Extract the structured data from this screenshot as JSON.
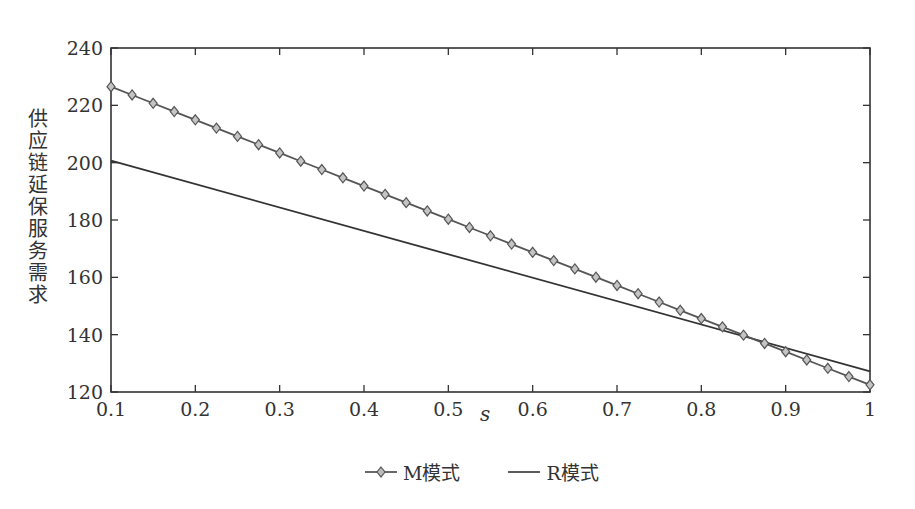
{
  "chart_data": {
    "type": "line",
    "title": "",
    "xlabel": "s",
    "ylabel": "供应链延保服务需求",
    "xlim": [
      0.1,
      1.0
    ],
    "ylim": [
      120,
      240
    ],
    "xticks": [
      0.1,
      0.2,
      0.3,
      0.4,
      0.5,
      0.6,
      0.7,
      0.8,
      0.9,
      1.0
    ],
    "xtick_labels": [
      "0.1",
      "0.2",
      "0.3",
      "0.4",
      "0.5",
      "0.6",
      "0.7",
      "0.8",
      "0.9",
      "1"
    ],
    "yticks": [
      120,
      140,
      160,
      180,
      200,
      220,
      240
    ],
    "ytick_labels": [
      "120",
      "140",
      "160",
      "180",
      "200",
      "220",
      "240"
    ],
    "grid": false,
    "legend_position": "bottom-center",
    "series": [
      {
        "name": "M模式",
        "marker": "diamond",
        "color": "#555555",
        "x": [
          0.1,
          0.125,
          0.15,
          0.175,
          0.2,
          0.225,
          0.25,
          0.275,
          0.3,
          0.325,
          0.35,
          0.375,
          0.4,
          0.425,
          0.45,
          0.475,
          0.5,
          0.525,
          0.55,
          0.575,
          0.6,
          0.625,
          0.65,
          0.675,
          0.7,
          0.725,
          0.75,
          0.775,
          0.8,
          0.825,
          0.85,
          0.875,
          0.9,
          0.925,
          0.95,
          0.975,
          1.0
        ],
        "start": 226.5,
        "end": 122.5
      },
      {
        "name": "R模式",
        "marker": "none",
        "color": "#333333",
        "x": [
          0.1,
          1.0
        ],
        "values": [
          200.7,
          127.2
        ]
      }
    ]
  },
  "labels": {
    "ylabel_chars": [
      "供",
      "应",
      "链",
      "延",
      "保",
      "服",
      "务",
      "需",
      "求"
    ],
    "xlabel": "s",
    "legend_m": "M模式",
    "legend_r": "R模式"
  }
}
